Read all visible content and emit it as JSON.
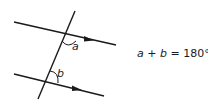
{
  "diagram": {
    "title": "",
    "labels": {
      "angle_a": "a",
      "angle_b": "b"
    },
    "formula": {
      "var1": "a",
      "op1": " + ",
      "var2": "b",
      "op2": " = ",
      "value": "180°"
    },
    "colors": {
      "stroke": "#1a1a1a",
      "background": "#ffffff"
    }
  }
}
